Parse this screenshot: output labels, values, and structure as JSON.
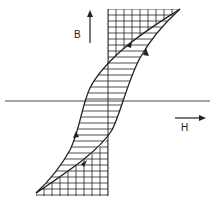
{
  "diagram": {
    "type": "hysteresis-loop",
    "axis_labels": {
      "vertical": "B",
      "horizontal": "H"
    },
    "colors": {
      "stroke": "#222222",
      "background": "#ffffff"
    },
    "regions": [
      {
        "name": "loop-interior",
        "fill": "horizontal-hatch"
      },
      {
        "name": "upper-region-between-curve-and-axis",
        "fill": "grid-hatch"
      },
      {
        "name": "lower-region-between-curve-and-axis",
        "fill": "grid-hatch"
      }
    ],
    "direction_arrows": 4
  }
}
